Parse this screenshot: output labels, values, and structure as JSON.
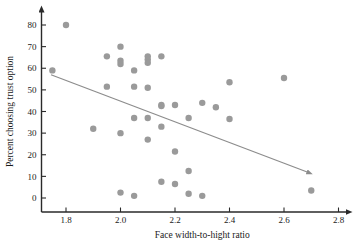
{
  "chart_data": {
    "type": "scatter",
    "title": "",
    "xlabel": "Face width-to-hight ratio",
    "ylabel": "Percent choosing trust option",
    "xlim": [
      1.7,
      2.85
    ],
    "ylim": [
      -6,
      86
    ],
    "xticks": [
      1.8,
      2.0,
      2.2,
      2.4,
      2.6,
      2.8
    ],
    "xtick_labels": [
      "1.8",
      "2.0",
      "2.2",
      "2.4",
      "2.6",
      "2.8"
    ],
    "yticks": [
      0,
      10,
      20,
      30,
      40,
      50,
      60,
      70,
      80
    ],
    "ytick_labels": [
      "0",
      "10",
      "20",
      "30",
      "40",
      "50",
      "60",
      "70",
      "80"
    ],
    "grid": false,
    "legend": null,
    "marker": {
      "shape": "circle",
      "size": 3.2,
      "color": "#9a9a9a"
    },
    "points": [
      {
        "x": 1.75,
        "y": 59.0
      },
      {
        "x": 1.8,
        "y": 80.0
      },
      {
        "x": 1.9,
        "y": 32.0
      },
      {
        "x": 1.95,
        "y": 65.5
      },
      {
        "x": 1.95,
        "y": 51.5
      },
      {
        "x": 2.0,
        "y": 70.0
      },
      {
        "x": 2.0,
        "y": 63.5
      },
      {
        "x": 2.0,
        "y": 62.0
      },
      {
        "x": 2.0,
        "y": 30.0
      },
      {
        "x": 2.0,
        "y": 2.5
      },
      {
        "x": 2.05,
        "y": 59.0
      },
      {
        "x": 2.05,
        "y": 51.5
      },
      {
        "x": 2.05,
        "y": 37.0
      },
      {
        "x": 2.05,
        "y": 1.0
      },
      {
        "x": 2.1,
        "y": 65.5
      },
      {
        "x": 2.1,
        "y": 64.0
      },
      {
        "x": 2.1,
        "y": 62.5
      },
      {
        "x": 2.1,
        "y": 51.0
      },
      {
        "x": 2.1,
        "y": 37.0
      },
      {
        "x": 2.1,
        "y": 27.0
      },
      {
        "x": 2.15,
        "y": 65.5
      },
      {
        "x": 2.15,
        "y": 43.0
      },
      {
        "x": 2.15,
        "y": 42.5
      },
      {
        "x": 2.15,
        "y": 33.0
      },
      {
        "x": 2.15,
        "y": 7.5
      },
      {
        "x": 2.2,
        "y": 43.0
      },
      {
        "x": 2.2,
        "y": 21.5
      },
      {
        "x": 2.2,
        "y": 6.5
      },
      {
        "x": 2.25,
        "y": 37.0
      },
      {
        "x": 2.25,
        "y": 12.5
      },
      {
        "x": 2.25,
        "y": 2.0
      },
      {
        "x": 2.3,
        "y": 44.0
      },
      {
        "x": 2.3,
        "y": 1.0
      },
      {
        "x": 2.35,
        "y": 42.0
      },
      {
        "x": 2.4,
        "y": 53.5
      },
      {
        "x": 2.4,
        "y": 36.5
      },
      {
        "x": 2.6,
        "y": 55.5
      },
      {
        "x": 2.7,
        "y": 3.5
      }
    ],
    "trendline": {
      "type": "line",
      "color": "#8c8c8c",
      "arrow_end": true,
      "x_start": 1.745,
      "y_start": 57.0,
      "x_end": 2.685,
      "y_end": 12.0
    },
    "axis_style": {
      "color": "#2a2a2a",
      "arrow_tips": true
    }
  }
}
